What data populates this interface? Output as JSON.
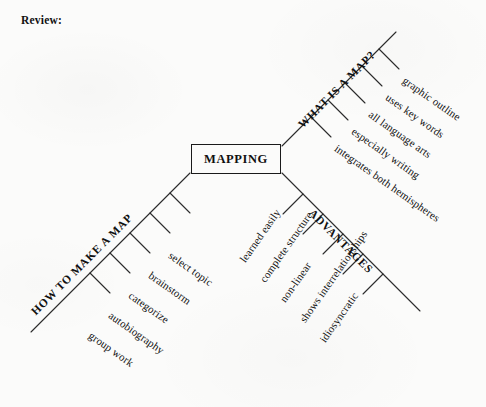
{
  "page": {
    "heading": "Review:",
    "paper_color": "#fbfbfa",
    "ink_color": "#1a1a1a"
  },
  "diagram": {
    "type": "mind-map",
    "center": {
      "label": "MAPPING"
    },
    "branches": [
      {
        "id": "what-is-a-map",
        "label": "WHAT IS A MAP?",
        "direction": "upper-right",
        "items": [
          "graphic outline",
          "uses key words",
          "all language arts",
          "especially writing",
          "integrates both hemispheres"
        ]
      },
      {
        "id": "advantages",
        "label": "ADVANTAGES",
        "direction": "lower-right",
        "items": [
          "learned easily",
          "complete structure",
          "non-linear",
          "shows interrelationships",
          "idiosyncratic"
        ]
      },
      {
        "id": "how-to-make-a-map",
        "label": "HOW TO MAKE A MAP",
        "direction": "lower-left",
        "items": [
          "select topic",
          "brainstorm",
          "categorize",
          "autobiography",
          "group work"
        ]
      }
    ]
  }
}
